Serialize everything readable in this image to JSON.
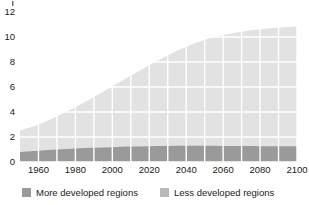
{
  "chart_data": {
    "type": "area",
    "stacked": true,
    "title": "",
    "subtitle": "",
    "xlabel": "",
    "ylabel": "",
    "xlim": [
      1950,
      2100
    ],
    "ylim": [
      0,
      12
    ],
    "y_ticks": [
      0,
      2,
      4,
      6,
      8,
      10,
      12
    ],
    "y_tick_labels": [
      "0",
      "2",
      "4",
      "6",
      "8",
      "10",
      "12"
    ],
    "x_ticks": [
      1960,
      1980,
      2000,
      2020,
      2040,
      2060,
      2080,
      2100
    ],
    "x_tick_labels": [
      "1960",
      "1980",
      "2000",
      "2020",
      "2040",
      "2060",
      "2080",
      "2100"
    ],
    "x_gridlines": [
      1960,
      1970,
      1980,
      1990,
      2000,
      2010,
      2020,
      2030,
      2040,
      2050,
      2060,
      2070,
      2080,
      2090,
      2100
    ],
    "grid": true,
    "grid_color": "#ffffff",
    "legend_position": "bottom",
    "plot_background": "#e2e2e2",
    "x": [
      1950,
      1960,
      1970,
      1980,
      1990,
      2000,
      2010,
      2020,
      2030,
      2040,
      2050,
      2060,
      2070,
      2080,
      2090,
      2100
    ],
    "series": [
      {
        "name": "More developed regions",
        "color": "#9a9a9a",
        "values": [
          0.81,
          0.91,
          1.0,
          1.08,
          1.14,
          1.19,
          1.24,
          1.27,
          1.29,
          1.3,
          1.3,
          1.29,
          1.28,
          1.27,
          1.26,
          1.25
        ]
      },
      {
        "name": "Less developed regions",
        "color": "#e2e2e2",
        "values": [
          1.72,
          2.09,
          2.67,
          3.3,
          4.06,
          4.87,
          5.66,
          6.47,
          7.25,
          7.93,
          8.47,
          8.87,
          9.15,
          9.35,
          9.5,
          9.6
        ]
      }
    ],
    "totals": [
      2.53,
      3.0,
      3.67,
      4.38,
      5.2,
      6.06,
      6.9,
      7.74,
      8.54,
      9.23,
      9.77,
      10.16,
      10.43,
      10.62,
      10.76,
      10.85
    ]
  },
  "legend": {
    "items": [
      {
        "label": "More developed regions",
        "color": "#9a9a9a"
      },
      {
        "label": "Less developed regions",
        "color": "#b9b9b9"
      }
    ]
  },
  "colors": {
    "more_developed": "#9a9a9a",
    "less_developed": "#e2e2e2",
    "less_developed_swatch": "#b9b9b9",
    "grid": "#ffffff",
    "text": "#1a1a1a",
    "background": "#ffffff"
  }
}
